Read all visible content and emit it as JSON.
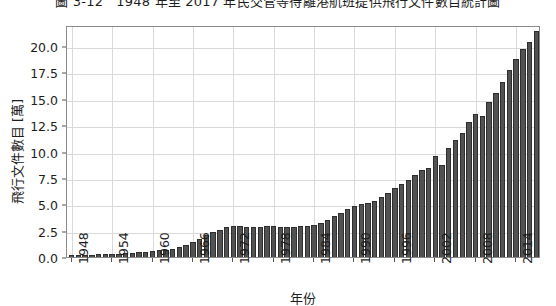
{
  "chart_data": {
    "type": "bar",
    "title": "圖 3-12　1948 年至 2017 年民交管等待離港航班提供飛行文件數目統計圖",
    "xlabel": "年份",
    "ylabel": "飛行文件數目 [萬]",
    "ylim": [
      0,
      22.0
    ],
    "yticks": [
      0.0,
      2.5,
      5.0,
      7.5,
      10.0,
      12.5,
      15.0,
      17.5,
      20.0
    ],
    "ytick_labels": [
      "0.0",
      "2.5",
      "5.0",
      "7.5",
      "10.0",
      "12.5",
      "15.0",
      "17.5",
      "20.0"
    ],
    "xticks": [
      1948,
      1954,
      1960,
      1966,
      1972,
      1978,
      1984,
      1990,
      1996,
      2002,
      2008,
      2014
    ],
    "xtick_labels": [
      "1948",
      "1954",
      "1960",
      "1966",
      "1972",
      "1978",
      "1984",
      "1990",
      "1996",
      "2002",
      "2008",
      "2014"
    ],
    "xlim": [
      1947.3,
      2017.7
    ],
    "grid": true,
    "legend": "none",
    "bar_color": "#525252",
    "bar_edge_color": "#2e2e2e",
    "categories": [
      1948,
      1949,
      1950,
      1951,
      1952,
      1953,
      1954,
      1955,
      1956,
      1957,
      1958,
      1959,
      1960,
      1961,
      1962,
      1963,
      1964,
      1965,
      1966,
      1967,
      1968,
      1969,
      1970,
      1971,
      1972,
      1973,
      1974,
      1975,
      1976,
      1977,
      1978,
      1979,
      1980,
      1981,
      1982,
      1983,
      1984,
      1985,
      1986,
      1987,
      1988,
      1989,
      1990,
      1991,
      1992,
      1993,
      1994,
      1995,
      1996,
      1997,
      1998,
      1999,
      2000,
      2001,
      2002,
      2003,
      2004,
      2005,
      2006,
      2007,
      2008,
      2009,
      2010,
      2011,
      2012,
      2013,
      2014,
      2015,
      2016,
      2017
    ],
    "values": [
      0.15,
      0.18,
      0.2,
      0.22,
      0.25,
      0.28,
      0.3,
      0.33,
      0.38,
      0.42,
      0.45,
      0.5,
      0.55,
      0.62,
      0.7,
      0.8,
      0.95,
      1.15,
      1.45,
      1.75,
      2.05,
      2.35,
      2.6,
      2.8,
      2.95,
      2.95,
      2.85,
      2.8,
      2.85,
      2.9,
      2.95,
      2.85,
      2.8,
      2.85,
      2.9,
      2.95,
      3.05,
      3.25,
      3.55,
      3.85,
      4.2,
      4.55,
      4.85,
      5.0,
      5.1,
      5.35,
      5.7,
      6.1,
      6.5,
      6.95,
      7.35,
      7.8,
      8.25,
      8.4,
      9.6,
      8.7,
      10.35,
      11.05,
      11.8,
      12.85,
      13.55,
      13.4,
      14.7,
      15.55,
      16.55,
      17.7,
      18.8,
      19.7,
      20.4,
      21.45
    ]
  }
}
